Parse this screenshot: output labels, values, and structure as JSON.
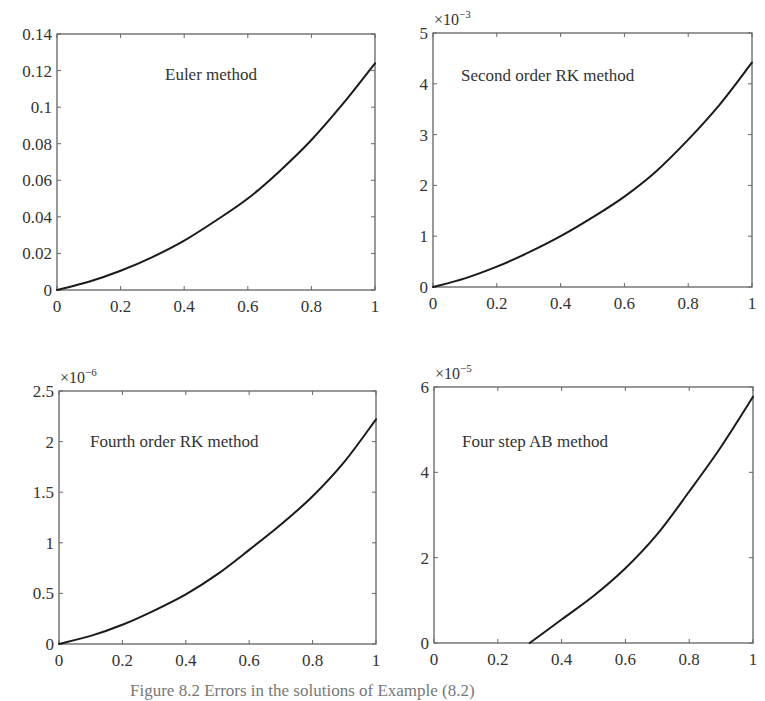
{
  "chart_data": [
    {
      "type": "line",
      "title": "",
      "annotation": "Euler method",
      "xlabel": "",
      "ylabel": "",
      "xlim": [
        0,
        1
      ],
      "ylim": [
        0,
        0.14
      ],
      "y_multiplier": "",
      "xticks": [
        0,
        0.2,
        0.4,
        0.6,
        0.8,
        1
      ],
      "xtick_labels": [
        "0",
        "0.2",
        "0.4",
        "0.6",
        "0.8",
        "1"
      ],
      "yticks": [
        0,
        0.02,
        0.04,
        0.06,
        0.08,
        0.1,
        0.12,
        0.14
      ],
      "ytick_labels": [
        "0",
        "0.02",
        "0.04",
        "0.06",
        "0.08",
        "0.1",
        "0.12",
        "0.14"
      ],
      "grid": false,
      "series": [
        {
          "name": "Euler error",
          "x": [
            0,
            0.1,
            0.2,
            0.3,
            0.4,
            0.5,
            0.6,
            0.7,
            0.8,
            0.9,
            1.0
          ],
          "values": [
            0,
            0.0045,
            0.0105,
            0.018,
            0.027,
            0.038,
            0.05,
            0.065,
            0.082,
            0.102,
            0.124
          ]
        }
      ]
    },
    {
      "type": "line",
      "title": "",
      "annotation": "Second order RK method",
      "xlabel": "",
      "ylabel": "",
      "xlim": [
        0,
        1
      ],
      "ylim": [
        0,
        5
      ],
      "y_multiplier": "×10",
      "y_multiplier_exp": "−3",
      "xticks": [
        0,
        0.2,
        0.4,
        0.6,
        0.8,
        1
      ],
      "xtick_labels": [
        "0",
        "0.2",
        "0.4",
        "0.6",
        "0.8",
        "1"
      ],
      "yticks": [
        0,
        1,
        2,
        3,
        4,
        5
      ],
      "ytick_labels": [
        "0",
        "1",
        "2",
        "3",
        "4",
        "5"
      ],
      "grid": false,
      "series": [
        {
          "name": "RK2 error (×10^-3)",
          "x": [
            0,
            0.1,
            0.2,
            0.3,
            0.4,
            0.5,
            0.6,
            0.7,
            0.8,
            0.9,
            1.0
          ],
          "values": [
            0,
            0.17,
            0.4,
            0.68,
            1.0,
            1.37,
            1.78,
            2.28,
            2.9,
            3.6,
            4.42
          ]
        }
      ]
    },
    {
      "type": "line",
      "title": "",
      "annotation": "Fourth order RK method",
      "xlabel": "",
      "ylabel": "",
      "xlim": [
        0,
        1
      ],
      "ylim": [
        0,
        2.5
      ],
      "y_multiplier": "×10",
      "y_multiplier_exp": "−6",
      "xticks": [
        0,
        0.2,
        0.4,
        0.6,
        0.8,
        1
      ],
      "xtick_labels": [
        "0",
        "0.2",
        "0.4",
        "0.6",
        "0.8",
        "1"
      ],
      "yticks": [
        0,
        0.5,
        1,
        1.5,
        2,
        2.5
      ],
      "ytick_labels": [
        "0",
        "0.5",
        "1",
        "1.5",
        "2",
        "2.5"
      ],
      "grid": false,
      "series": [
        {
          "name": "RK4 error (×10^-6)",
          "x": [
            0,
            0.1,
            0.2,
            0.3,
            0.4,
            0.5,
            0.6,
            0.7,
            0.8,
            0.9,
            1.0
          ],
          "values": [
            0,
            0.08,
            0.19,
            0.33,
            0.49,
            0.69,
            0.93,
            1.18,
            1.46,
            1.8,
            2.22
          ]
        }
      ]
    },
    {
      "type": "line",
      "title": "",
      "annotation": "Four step AB method",
      "xlabel": "",
      "ylabel": "",
      "xlim": [
        0,
        1
      ],
      "ylim": [
        0,
        6
      ],
      "y_multiplier": "×10",
      "y_multiplier_exp": "−5",
      "xticks": [
        0,
        0.2,
        0.4,
        0.6,
        0.8,
        1
      ],
      "xtick_labels": [
        "0",
        "0.2",
        "0.4",
        "0.6",
        "0.8",
        "1"
      ],
      "yticks": [
        0,
        2,
        4,
        6
      ],
      "ytick_labels": [
        "0",
        "2",
        "4",
        "6"
      ],
      "grid": false,
      "series": [
        {
          "name": "AB4 error (×10^-5)",
          "x": [
            0.3,
            0.4,
            0.5,
            0.6,
            0.7,
            0.8,
            0.9,
            1.0
          ],
          "values": [
            0,
            0.55,
            1.1,
            1.75,
            2.55,
            3.55,
            4.6,
            5.77
          ]
        }
      ]
    }
  ],
  "caption": "Figure 8.2   Errors in the solutions of Example (8.2)"
}
